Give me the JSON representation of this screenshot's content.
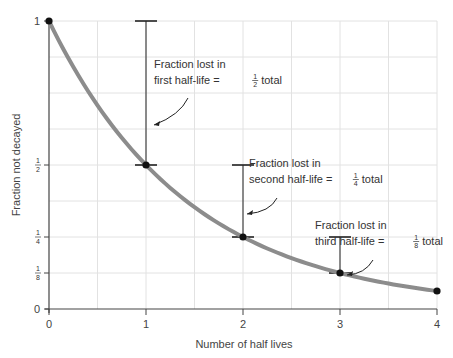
{
  "chart_data": {
    "type": "line",
    "title": "",
    "xlabel": "Number of half lives",
    "ylabel": "Fraction not decayed",
    "x": [
      0,
      1,
      2,
      3,
      4
    ],
    "series": [
      {
        "name": "Fraction not decayed",
        "values": [
          1,
          0.5,
          0.25,
          0.125,
          0.0625
        ],
        "color": "#8c8c8c"
      }
    ],
    "xlim": [
      0,
      4
    ],
    "ylim": [
      0,
      1
    ],
    "x_ticks": [
      "0",
      "1",
      "2",
      "3",
      "4"
    ],
    "y_ticks": [
      {
        "value": 0,
        "label": "0"
      },
      {
        "value": 0.125,
        "label": "1/8"
      },
      {
        "value": 0.25,
        "label": "1/4"
      },
      {
        "value": 0.5,
        "label": "1/2"
      },
      {
        "value": 1,
        "label": "1"
      }
    ],
    "grid": true,
    "annotations": [
      {
        "line1": "Fraction lost in",
        "line2_pre": "first half-life =",
        "frac_num": "1",
        "frac_den": "2",
        "line2_post": "total",
        "bracket_x": 1,
        "from": 1,
        "to": 0.5
      },
      {
        "line1": "Fraction lost in",
        "line2_pre": "second half-life =",
        "frac_num": "1",
        "frac_den": "4",
        "line2_post": "total",
        "bracket_x": 2,
        "from": 0.5,
        "to": 0.25
      },
      {
        "line1": "Fraction lost in",
        "line2_pre": "third half-life =",
        "frac_num": "1",
        "frac_den": "8",
        "line2_post": "total",
        "bracket_x": 3,
        "from": 0.25,
        "to": 0.125
      }
    ]
  }
}
